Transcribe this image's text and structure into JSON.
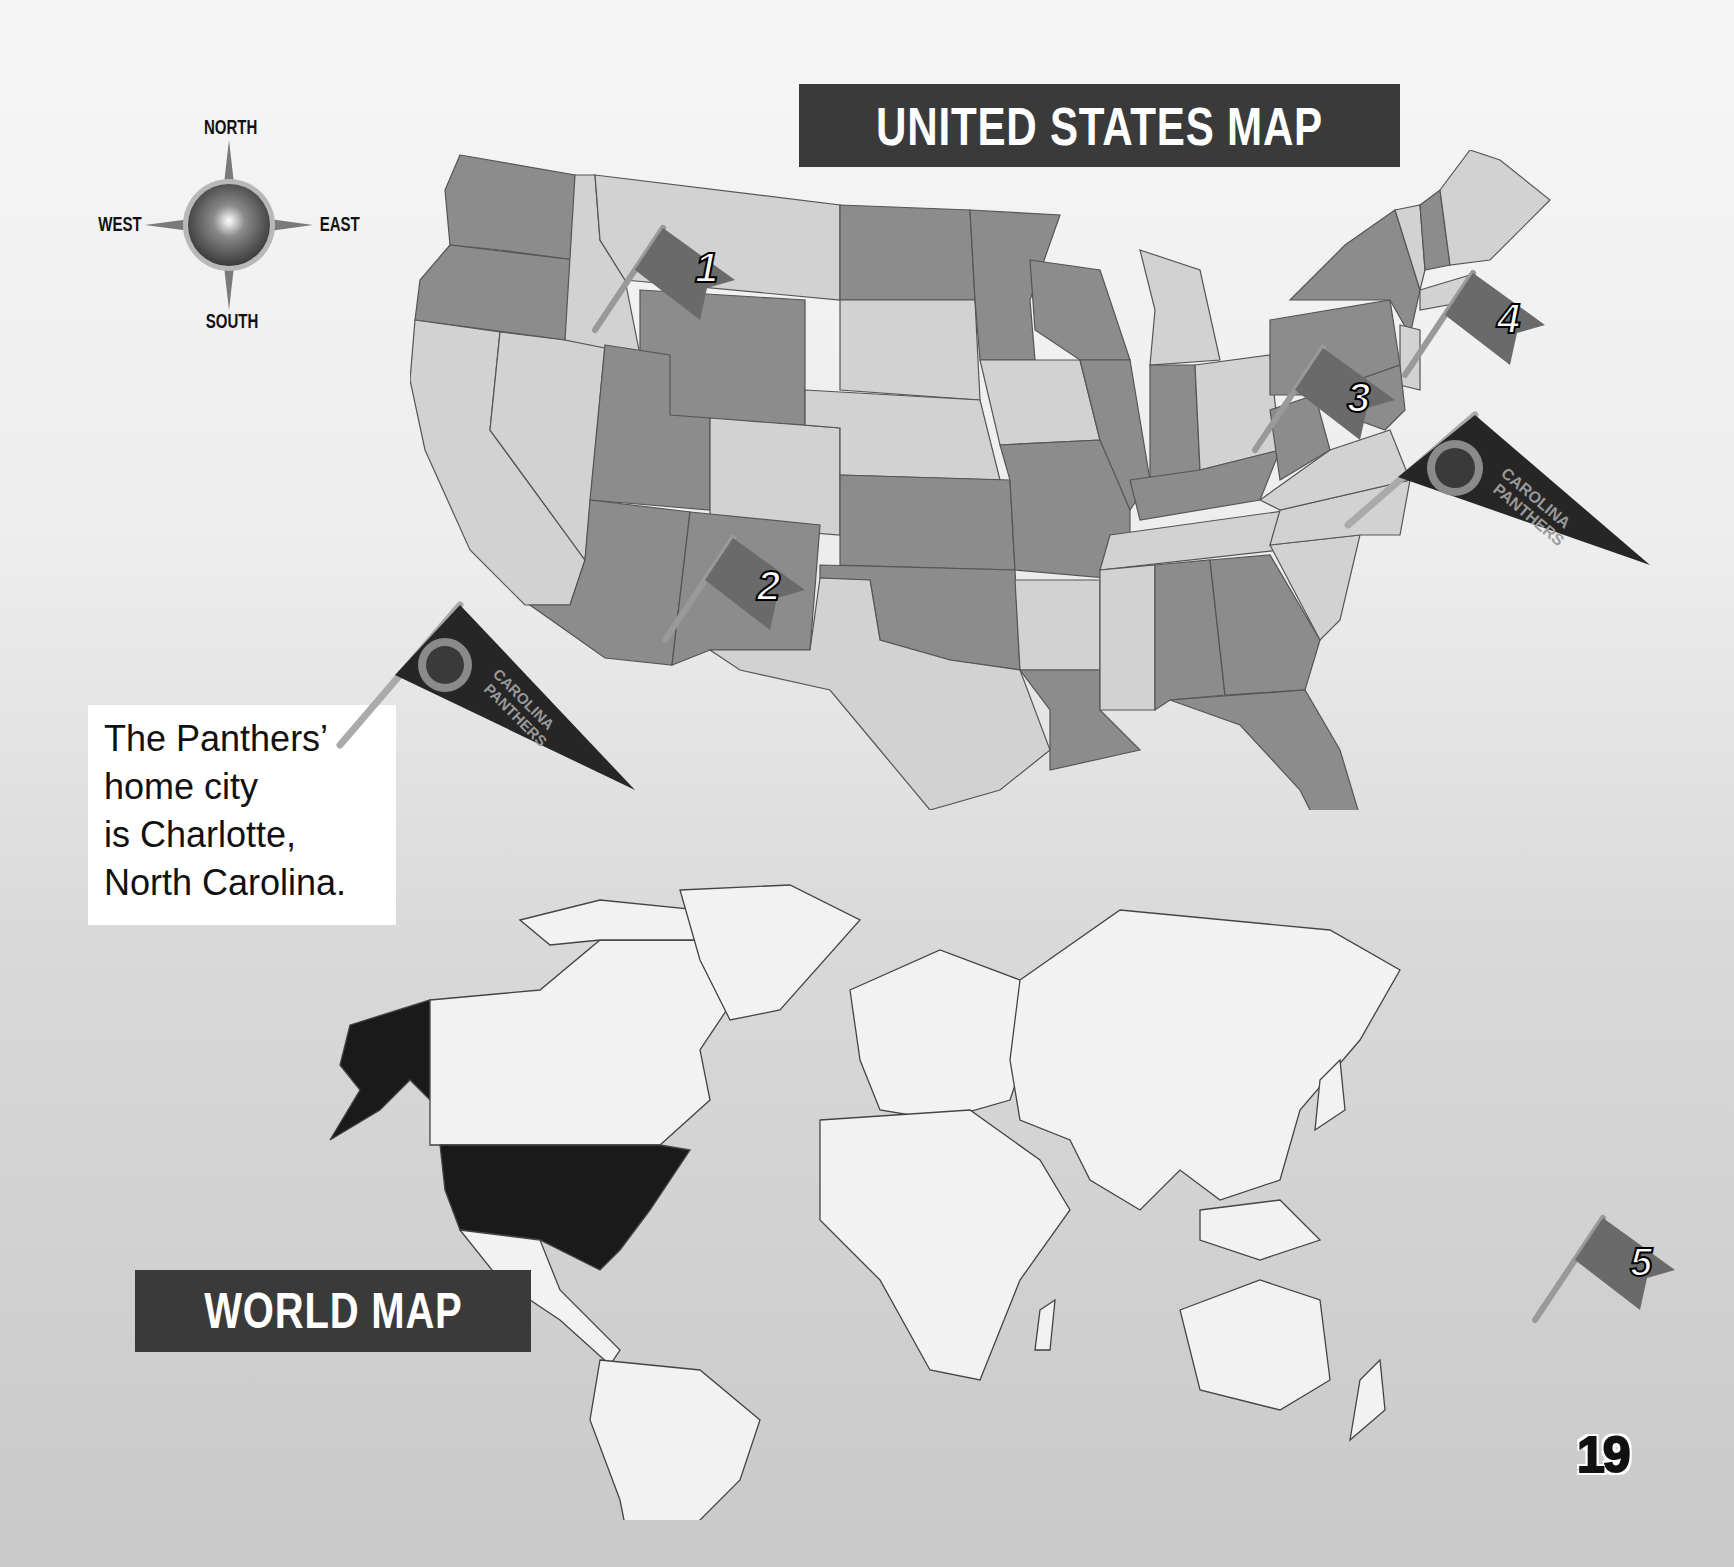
{
  "page": {
    "page_number": "19",
    "background_gradient": [
      "#f6f6f6",
      "#c9c9c9"
    ]
  },
  "compass": {
    "north": "NORTH",
    "south": "SOUTH",
    "east": "EAST",
    "west": "WEST"
  },
  "us_map": {
    "title": "UNITED STATES MAP",
    "flags": [
      {
        "number": "1",
        "location": "Idaho/Montana"
      },
      {
        "number": "2",
        "location": "Arizona/New Mexico"
      },
      {
        "number": "3",
        "location": "Pennsylvania/West Virginia"
      },
      {
        "number": "4",
        "location": "New York/New England"
      }
    ],
    "pennant": {
      "text_line1": "CAROLINA",
      "text_line2": "PANTHERS",
      "location": "North Carolina"
    },
    "colors": {
      "dark_state": "#8c8c8c",
      "light_state": "#d2d2d2",
      "border": "#555555"
    }
  },
  "caption": {
    "lines": [
      "The Panthers’",
      "home city",
      "is Charlotte,",
      "North Carolina."
    ]
  },
  "pennant_caption": {
    "text_line1": "CAROLINA",
    "text_line2": "PANTHERS"
  },
  "world_map": {
    "title": "WORLD MAP",
    "highlighted_country": "United States",
    "highlight_color": "#1a1a1a",
    "land_color": "#f2f2f2",
    "flag": {
      "number": "5"
    }
  }
}
